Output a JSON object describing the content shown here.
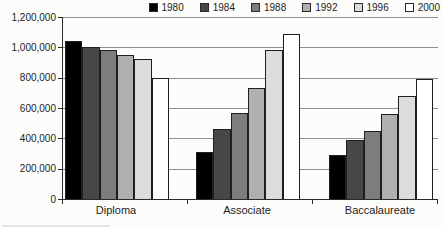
{
  "chart_data": {
    "type": "bar",
    "title": "",
    "xlabel": "",
    "ylabel": "",
    "categories": [
      "Diploma",
      "Associate",
      "Baccalaureate"
    ],
    "series": [
      {
        "name": "1980",
        "color": "#000000",
        "values": [
          1040000,
          310000,
          290000
        ]
      },
      {
        "name": "1984",
        "color": "#474747",
        "values": [
          1000000,
          460000,
          390000
        ]
      },
      {
        "name": "1988",
        "color": "#7d7d7d",
        "values": [
          980000,
          570000,
          450000
        ]
      },
      {
        "name": "1992",
        "color": "#b0b0b0",
        "values": [
          950000,
          730000,
          560000
        ]
      },
      {
        "name": "1996",
        "color": "#dcdcdc",
        "values": [
          920000,
          980000,
          680000
        ]
      },
      {
        "name": "2000",
        "color": "#ffffff",
        "values": [
          800000,
          1090000,
          790000
        ]
      }
    ],
    "ylim": [
      0,
      1200000
    ],
    "y_tick_step": 200000,
    "y_tick_labels": [
      "0",
      "200,000",
      "400,000",
      "600,000",
      "800,000",
      "1,000,000",
      "1,200,000"
    ],
    "grid": true,
    "legend_position": "top-right",
    "bar_outline_color": "#1f1f1f",
    "gridline_color": "#909090",
    "axis_color": "#2a2a2a"
  }
}
